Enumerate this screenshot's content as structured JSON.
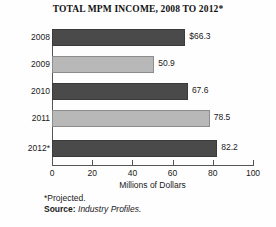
{
  "chart_data": {
    "type": "bar",
    "orientation": "horizontal",
    "title": "TOTAL MPM INCOME, 2008 TO 2012*",
    "categories": [
      "2008",
      "2009",
      "2010",
      "2011",
      "2012*"
    ],
    "values": [
      66.3,
      67.6,
      50.9,
      78.5,
      82.2
    ],
    "series": [
      {
        "name": "Total MPM Income",
        "values": [
          66.3,
          50.9,
          67.6,
          78.5,
          82.2
        ]
      }
    ],
    "value_labels": [
      "$66.3",
      "50.9",
      "67.6",
      "78.5",
      "82.2"
    ],
    "bar_styles": [
      "dark",
      "light",
      "dark",
      "light",
      "dark"
    ],
    "xlabel": "Millions of Dollars",
    "ylabel": "",
    "xlim": [
      0,
      100
    ],
    "xticks": [
      0,
      20,
      40,
      60,
      80,
      100
    ],
    "xtick_labels": [
      "0",
      "20",
      "40",
      "60",
      "80",
      "100"
    ],
    "grid": false,
    "legend": "none",
    "colors": {
      "dark_bar": "#4a4a4a",
      "light_bar": "#b8b8b8",
      "axis": "#555555",
      "text": "#1a1a1a",
      "background": "#fefefe"
    }
  },
  "footnotes": {
    "projected": "*Projected.",
    "source_label": "Source:",
    "source_value": "Industry Profiles."
  }
}
